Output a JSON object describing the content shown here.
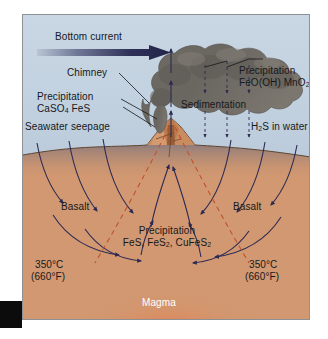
{
  "figure": {
    "labels": {
      "bottom_current": "Bottom current",
      "chimney": "Chimney",
      "precipitation_chimney_line1": "Precipitation",
      "precipitation_chimney_line2": "CaSO4 FeS",
      "seawater_seepage": "Seawater seepage",
      "precipitation_plume_line1": "Precipitation",
      "precipitation_plume_line2": "FeO(OH) MnO2",
      "sedimentation": "Sedimentation",
      "h2s_in_water": "H2S in water",
      "basalt_left": "Basalt",
      "basalt_right": "Basalt",
      "precipitation_sub_line1": "Precipitation",
      "precipitation_sub_line2": "FeS, FeS2, CuFeS2",
      "temp_left_line1": "350°C",
      "temp_left_line2": "(660°F)",
      "temp_right_line1": "350°C",
      "temp_right_line2": "(660°F)",
      "magma": "Magma"
    },
    "colors": {
      "water": "#c3d2e0",
      "basalt": "#d39a72",
      "sediment_layer": "#6d6f84",
      "plume_smoke": "#6b6762",
      "magma_glow": "#f53b10",
      "flow_arrow": "#2d2a52",
      "isotherm_dashed": "#c0532a",
      "frame_border": "#8d9094"
    }
  }
}
